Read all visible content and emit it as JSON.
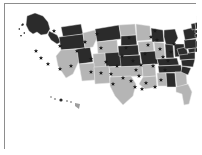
{
  "figure": {
    "kind": "choropleth-map",
    "region": "United States",
    "background_color": "#ffffff",
    "frame_color": "#8d8d8d",
    "shadow_color": "#c9c9c9"
  },
  "legend_colors": {
    "highlighted_fill": "#2b2b2b",
    "base_fill": "#b5b5b5",
    "state_border": "#e8e8e8",
    "marker_color": "#1a1a1a"
  },
  "chart_data": {
    "type": "heatmap",
    "title": "",
    "xlabel": "",
    "ylabel": "",
    "categories": [
      "AK",
      "WA",
      "OR",
      "CA",
      "NV",
      "ID",
      "MT",
      "WY",
      "UT",
      "AZ",
      "NM",
      "CO",
      "ND",
      "SD",
      "NE",
      "KS",
      "OK",
      "TX",
      "MN",
      "IA",
      "MO",
      "AR",
      "LA",
      "WI",
      "IL",
      "MI",
      "IN",
      "OH",
      "KY",
      "TN",
      "MS",
      "AL",
      "GA",
      "FL",
      "SC",
      "NC",
      "VA",
      "WV",
      "PA",
      "NY",
      "VT",
      "NH",
      "ME",
      "MA",
      "RI",
      "CT",
      "NJ",
      "DE",
      "MD",
      "HI"
    ],
    "values": [
      1,
      1,
      1,
      0,
      1,
      0,
      1,
      0,
      0,
      0,
      0,
      1,
      0,
      1,
      1,
      1,
      0,
      0,
      0,
      0,
      1,
      0,
      0,
      1,
      0,
      1,
      1,
      1,
      1,
      1,
      0,
      1,
      0,
      0,
      1,
      1,
      1,
      1,
      1,
      1,
      1,
      1,
      1,
      1,
      1,
      1,
      1,
      1,
      1,
      0
    ],
    "value_labels": {
      "0": "base",
      "1": "highlighted"
    },
    "marker_counts_by_region": {
      "west": 6,
      "midwest": 9,
      "south": 16,
      "northeast": 13
    },
    "total_markers": 44,
    "grid": false,
    "legend_position": "none"
  },
  "markers": [
    [
      49,
      27
    ],
    [
      31,
      47
    ],
    [
      36,
      54
    ],
    [
      43,
      60
    ],
    [
      55,
      65
    ],
    [
      66,
      62
    ],
    [
      55,
      42
    ],
    [
      72,
      47
    ],
    [
      80,
      38
    ],
    [
      86,
      55
    ],
    [
      92,
      30
    ],
    [
      96,
      44
    ],
    [
      101,
      58
    ],
    [
      86,
      68
    ],
    [
      96,
      69
    ],
    [
      106,
      70
    ],
    [
      112,
      62
    ],
    [
      117,
      52
    ],
    [
      121,
      44
    ],
    [
      124,
      34
    ],
    [
      128,
      57
    ],
    [
      131,
      66
    ],
    [
      118,
      74
    ],
    [
      126,
      77
    ],
    [
      134,
      72
    ],
    [
      136,
      61
    ],
    [
      140,
      50
    ],
    [
      143,
      41
    ],
    [
      146,
      33
    ],
    [
      150,
      27
    ],
    [
      152,
      36
    ],
    [
      155,
      45
    ],
    [
      158,
      53
    ],
    [
      148,
      62
    ],
    [
      141,
      79
    ],
    [
      150,
      83
    ],
    [
      156,
      76
    ],
    [
      160,
      66
    ],
    [
      163,
      57
    ],
    [
      166,
      48
    ],
    [
      169,
      40
    ],
    [
      137,
      85
    ],
    [
      130,
      83
    ],
    [
      108,
      80
    ]
  ]
}
